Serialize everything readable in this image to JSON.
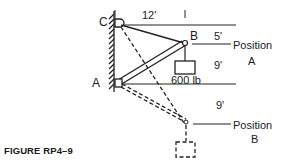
{
  "figure": {
    "caption": "FIGURE RP4–9",
    "points": {
      "C": "C",
      "A": "A",
      "B": "B"
    },
    "dimensions": {
      "horizontal": "12'",
      "top_gap": "5'",
      "middle_gap": "9'",
      "lower_gap": "9'"
    },
    "load": "600 lb",
    "positions": {
      "a_line1": "Position",
      "a_line2": "A",
      "b_line1": "Position",
      "b_line2": "B"
    }
  }
}
